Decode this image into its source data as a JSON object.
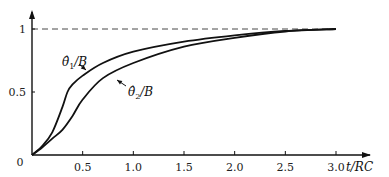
{
  "chart_data": {
    "type": "line",
    "title": "",
    "xlabel": "t/RC",
    "ylabel": "",
    "xlim": [
      0,
      3.1
    ],
    "ylim": [
      0,
      1.1
    ],
    "x_ticks": [
      "0.5",
      "1.0",
      "1.5",
      "2.0",
      "2.5",
      "3.0"
    ],
    "y_ticks": [
      "0.5",
      "1"
    ],
    "origin_label": "0",
    "reference_line": {
      "y": 1,
      "style": "dashed"
    },
    "grid": false,
    "series": [
      {
        "name": "θ̂1/B",
        "label_main": "θ̂",
        "label_sub": "1",
        "label_tail": "/B",
        "x": [
          0,
          0.1,
          0.2,
          0.3,
          0.35,
          0.4,
          0.5,
          0.7,
          1.0,
          1.5,
          2.0,
          2.5,
          3.0
        ],
        "y": [
          0,
          0.07,
          0.18,
          0.38,
          0.5,
          0.56,
          0.63,
          0.73,
          0.82,
          0.9,
          0.95,
          0.985,
          1.0
        ]
      },
      {
        "name": "θ̂2/B",
        "label_main": "θ̂",
        "label_sub": "2",
        "label_tail": "/B",
        "x": [
          0,
          0.1,
          0.2,
          0.3,
          0.4,
          0.5,
          0.7,
          1.0,
          1.5,
          2.0,
          2.5,
          3.0
        ],
        "y": [
          0,
          0.06,
          0.13,
          0.2,
          0.31,
          0.44,
          0.61,
          0.73,
          0.86,
          0.93,
          0.98,
          1.0
        ]
      }
    ]
  }
}
